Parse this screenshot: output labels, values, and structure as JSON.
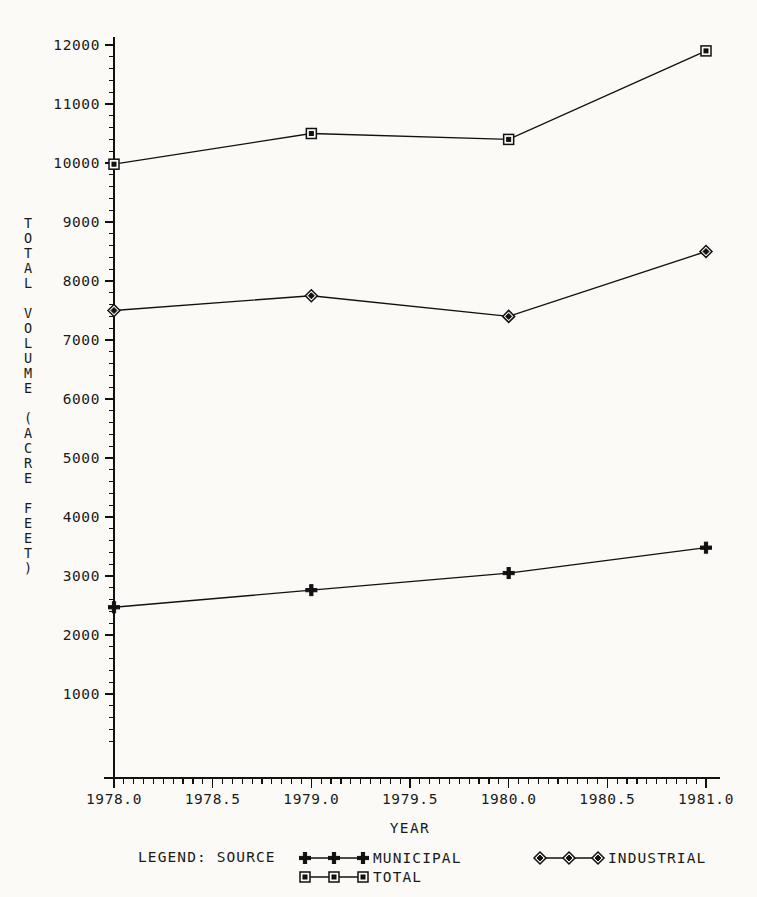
{
  "chart_data": {
    "type": "line",
    "title": "",
    "xlabel": "YEAR",
    "ylabel": "TOTAL VOLUME (ACRE FEET)",
    "ylabel_lines": [
      "TOTAL",
      "VOLUME",
      "(ACRE",
      "FEET)"
    ],
    "x": [
      1978.0,
      1979.0,
      1980.0,
      1981.0
    ],
    "xlim": [
      1978.0,
      1981.0
    ],
    "ylim": [
      0,
      12000
    ],
    "grid": false,
    "legend_position": "bottom",
    "legend_title": "LEGEND: SOURCE",
    "xticks": [
      "1978.0",
      "1978.5",
      "1979.0",
      "1979.5",
      "1980.0",
      "1980.5",
      "1981.0"
    ],
    "xtick_values": [
      1978.0,
      1978.5,
      1979.0,
      1979.5,
      1980.0,
      1980.5,
      1981.0
    ],
    "yticks": [
      "1000",
      "2000",
      "3000",
      "4000",
      "5000",
      "6000",
      "7000",
      "8000",
      "9000",
      "10000",
      "11000",
      "12000"
    ],
    "ytick_values": [
      1000,
      2000,
      3000,
      4000,
      5000,
      6000,
      7000,
      8000,
      9000,
      10000,
      11000,
      12000
    ],
    "x_minor_per_major": 10,
    "y_minor_per_major": 4,
    "series": [
      {
        "name": "MUNICIPAL",
        "marker": "plus",
        "values": [
          2470,
          2760,
          3050,
          3480
        ]
      },
      {
        "name": "INDUSTRIAL",
        "marker": "diamond",
        "values": [
          7500,
          7750,
          7400,
          8500
        ]
      },
      {
        "name": "TOTAL",
        "marker": "square",
        "values": [
          9980,
          10500,
          10400,
          11900
        ]
      }
    ],
    "colors": {
      "line": "#111111",
      "background": "#fbfaf7",
      "text": "#1a1a1a"
    }
  },
  "legend": {
    "title": "LEGEND: SOURCE",
    "entries": [
      {
        "label": "MUNICIPAL",
        "marker": "plus"
      },
      {
        "label": "INDUSTRIAL",
        "marker": "diamond"
      },
      {
        "label": "TOTAL",
        "marker": "square"
      }
    ]
  },
  "axes": {
    "x_title": "YEAR",
    "y_title_chars": [
      "T",
      "O",
      "T",
      "A",
      "L",
      "",
      "V",
      "O",
      "L",
      "U",
      "M",
      "E",
      "",
      "(",
      "A",
      "C",
      "R",
      "E",
      "",
      "F",
      "E",
      "E",
      "T",
      ")"
    ]
  }
}
